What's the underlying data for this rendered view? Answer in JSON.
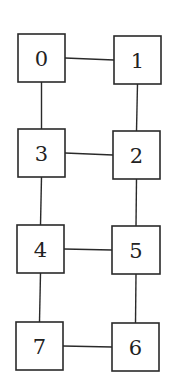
{
  "diagram": {
    "type": "graph",
    "nodes": [
      {
        "id": "0",
        "label": "0",
        "x": 18,
        "y": 34,
        "w": 47,
        "h": 48
      },
      {
        "id": "1",
        "label": "1",
        "x": 114,
        "y": 36,
        "w": 47,
        "h": 48
      },
      {
        "id": "3",
        "label": "3",
        "x": 18,
        "y": 129,
        "w": 47,
        "h": 48
      },
      {
        "id": "2",
        "label": "2",
        "x": 113,
        "y": 131,
        "w": 47,
        "h": 48
      },
      {
        "id": "4",
        "label": "4",
        "x": 17,
        "y": 225,
        "w": 47,
        "h": 48
      },
      {
        "id": "5",
        "label": "5",
        "x": 112,
        "y": 226,
        "w": 48,
        "h": 48
      },
      {
        "id": "7",
        "label": "7",
        "x": 16,
        "y": 322,
        "w": 47,
        "h": 48
      },
      {
        "id": "6",
        "label": "6",
        "x": 112,
        "y": 323,
        "w": 47,
        "h": 48
      }
    ],
    "edges": [
      {
        "from": "0",
        "to": "1"
      },
      {
        "from": "0",
        "to": "3"
      },
      {
        "from": "1",
        "to": "2"
      },
      {
        "from": "3",
        "to": "2"
      },
      {
        "from": "3",
        "to": "4"
      },
      {
        "from": "2",
        "to": "5"
      },
      {
        "from": "4",
        "to": "5"
      },
      {
        "from": "4",
        "to": "7"
      },
      {
        "from": "5",
        "to": "6"
      },
      {
        "from": "7",
        "to": "6"
      }
    ]
  }
}
